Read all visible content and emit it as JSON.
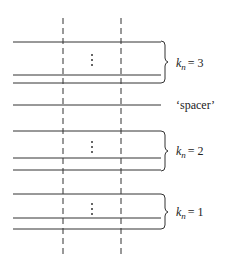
{
  "diagram": {
    "groups": [
      {
        "id": "group-3",
        "label_var": "k",
        "label_sub": "n",
        "label_value": "= 3",
        "lines_y": [
          42,
          75,
          83
        ],
        "dots_y": 61,
        "brace": [
          40,
          85
        ]
      },
      {
        "id": "group-2",
        "label_var": "k",
        "label_sub": "n",
        "label_value": "= 2",
        "lines_y": [
          131,
          158,
          170
        ],
        "dots_y": 148,
        "brace": [
          131,
          170
        ]
      },
      {
        "id": "group-1",
        "label_var": "k",
        "label_sub": "n",
        "label_value": "= 1",
        "lines_y": [
          194,
          218,
          229
        ],
        "dots_y": 210,
        "brace": [
          194,
          229
        ]
      }
    ],
    "spacer": {
      "label": "‘spacer’",
      "line_y": 105
    },
    "dashed_columns_x": [
      63,
      121
    ],
    "colors": {
      "line": "#333333",
      "background": "#ffffff"
    }
  }
}
